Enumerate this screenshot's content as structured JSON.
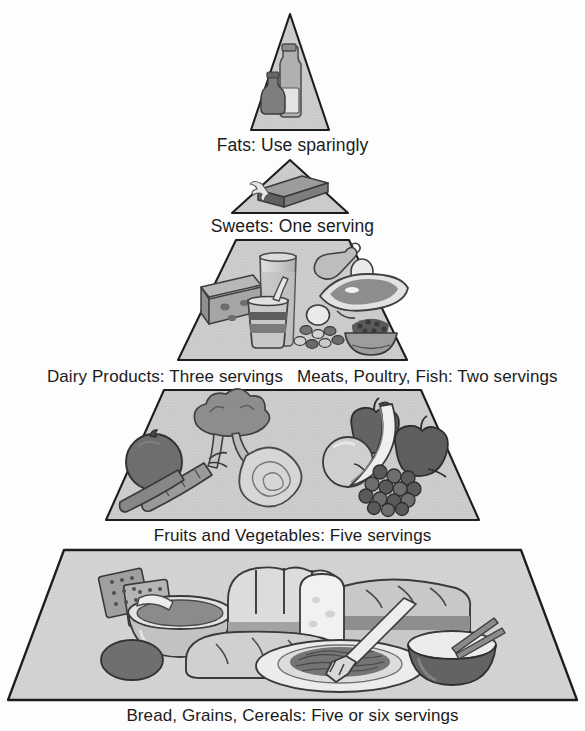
{
  "figure": {
    "type": "pyramid-diagram",
    "orientation": "apex-top",
    "style": "grayscale halftone illustration",
    "colors": {
      "tier_fill": "#c9c9c9",
      "tier_fill_light": "#d4d4d4",
      "outline": "#1d1d1d",
      "label_text": "#1b1b1b",
      "background": "#ffffff",
      "illustration_dark": "#6f6f6f",
      "illustration_mid": "#9a9a9a",
      "illustration_light": "#d8d8d8"
    }
  },
  "tiers": [
    {
      "index": 1,
      "name": "fats",
      "label": "Fats: Use sparingly",
      "food_group": "Fats",
      "servings_text": "Use sparingly",
      "servings_count": null,
      "icons": [
        "oil-bottle-icon",
        "vinegar-cruet-icon"
      ]
    },
    {
      "index": 2,
      "name": "sweets",
      "label": "Sweets: One serving",
      "food_group": "Sweets",
      "servings_text": "One serving",
      "servings_count": 1,
      "icons": [
        "candy-bar-icon"
      ]
    },
    {
      "index": 3,
      "name": "dairy-and-protein",
      "label_left": "Dairy Products: Three servings",
      "label_right": "Meats, Poultry, Fish: Two servings",
      "left": {
        "food_group": "Dairy Products",
        "servings_text": "Three servings",
        "servings_count": 3,
        "icons": [
          "cheese-wedge-icon",
          "milk-glass-icon",
          "yogurt-cup-icon"
        ]
      },
      "right": {
        "food_group": "Meats, Poultry, Fish",
        "servings_text": "Two servings",
        "servings_count": 2,
        "icons": [
          "chicken-drumstick-icon",
          "egg-icon",
          "fish-fillet-icon",
          "beans-bowl-icon",
          "nuts-icon"
        ]
      }
    },
    {
      "index": 4,
      "name": "fruits-and-vegetables",
      "label": "Fruits and Vegetables: Five servings",
      "food_group": "Fruits and Vegetables",
      "servings_text": "Five servings",
      "servings_count": 5,
      "icons": [
        "tomato-icon",
        "broccoli-icon",
        "carrot-icon",
        "lettuce-icon",
        "apple-icon",
        "orange-icon",
        "banana-icon",
        "grapes-icon"
      ]
    },
    {
      "index": 5,
      "name": "bread-grains-cereals",
      "label": "Bread, Grains, Cereals: Five or six servings",
      "food_group": "Bread, Grains, Cereals",
      "servings_text": "Five or six servings",
      "servings_count": "5-6",
      "icons": [
        "crackers-icon",
        "cereal-bowl-icon",
        "bread-loaf-icon",
        "bread-slice-icon",
        "dinner-roll-icon",
        "pasta-plate-icon",
        "fork-icon",
        "rice-bowl-icon",
        "chopsticks-icon"
      ]
    }
  ]
}
